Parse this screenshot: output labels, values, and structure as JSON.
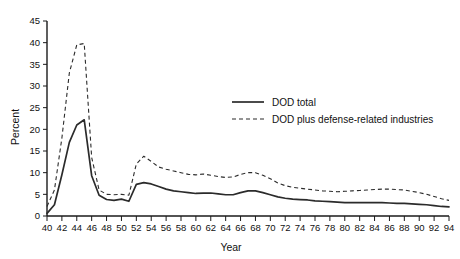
{
  "chart_data": {
    "type": "line",
    "title": "",
    "xlabel": "Year",
    "ylabel": "Percent",
    "xlim": [
      40,
      94
    ],
    "ylim": [
      0,
      45
    ],
    "grid": false,
    "legend_position": "inside-upper-right",
    "x_tick_labels": [
      "40",
      "42",
      "44",
      "46",
      "48",
      "50",
      "52",
      "54",
      "56",
      "58",
      "60",
      "62",
      "64",
      "66",
      "68",
      "70",
      "72",
      "74",
      "76",
      "78",
      "80",
      "82",
      "84",
      "86",
      "88",
      "90",
      "92",
      "94"
    ],
    "y_tick_labels": [
      "0",
      "5",
      "10",
      "15",
      "20",
      "25",
      "30",
      "35",
      "40",
      "45"
    ],
    "x_tick_values": [
      40,
      42,
      44,
      46,
      48,
      50,
      52,
      54,
      56,
      58,
      60,
      62,
      64,
      66,
      68,
      70,
      72,
      74,
      76,
      78,
      80,
      82,
      84,
      86,
      88,
      90,
      92,
      94
    ],
    "y_tick_values": [
      0,
      5,
      10,
      15,
      20,
      25,
      30,
      35,
      40,
      45
    ],
    "x": [
      40,
      41,
      42,
      43,
      44,
      45,
      46,
      47,
      48,
      49,
      50,
      51,
      52,
      53,
      54,
      55,
      56,
      57,
      58,
      59,
      60,
      61,
      62,
      63,
      64,
      65,
      66,
      67,
      68,
      69,
      70,
      71,
      72,
      73,
      74,
      75,
      76,
      77,
      78,
      79,
      80,
      81,
      82,
      83,
      84,
      85,
      86,
      87,
      88,
      89,
      90,
      91,
      92,
      93,
      94
    ],
    "series": [
      {
        "name": "DOD total",
        "style": "solid",
        "values": [
          0.6,
          2.6,
          9.5,
          17.0,
          21.0,
          22.2,
          9.3,
          4.8,
          3.8,
          3.6,
          3.9,
          3.4,
          7.3,
          7.7,
          7.4,
          6.8,
          6.2,
          5.8,
          5.6,
          5.4,
          5.2,
          5.3,
          5.3,
          5.1,
          4.9,
          4.9,
          5.4,
          5.8,
          5.8,
          5.4,
          4.9,
          4.4,
          4.1,
          3.9,
          3.8,
          3.7,
          3.5,
          3.4,
          3.3,
          3.2,
          3.1,
          3.1,
          3.1,
          3.1,
          3.1,
          3.1,
          3.0,
          2.9,
          2.9,
          2.8,
          2.7,
          2.6,
          2.4,
          2.2,
          2.1
        ]
      },
      {
        "name": "DOD plus defense-related industries",
        "style": "dashed",
        "values": [
          2.2,
          6.0,
          18.0,
          33.0,
          39.5,
          39.8,
          13.5,
          6.0,
          5.0,
          4.9,
          5.0,
          4.8,
          12.0,
          13.8,
          12.6,
          11.3,
          10.8,
          10.4,
          10.0,
          9.6,
          9.5,
          9.7,
          9.4,
          9.1,
          8.9,
          9.0,
          9.6,
          10.0,
          10.0,
          9.4,
          8.6,
          7.6,
          7.0,
          6.6,
          6.4,
          6.2,
          6.0,
          5.8,
          5.7,
          5.6,
          5.7,
          5.8,
          5.9,
          6.0,
          6.1,
          6.2,
          6.2,
          6.1,
          6.0,
          5.7,
          5.4,
          5.0,
          4.5,
          4.0,
          3.6
        ]
      }
    ],
    "legend_entries": [
      {
        "label": "DOD total",
        "style": "solid"
      },
      {
        "label": "DOD plus defense-related industries",
        "style": "dashed"
      }
    ]
  }
}
